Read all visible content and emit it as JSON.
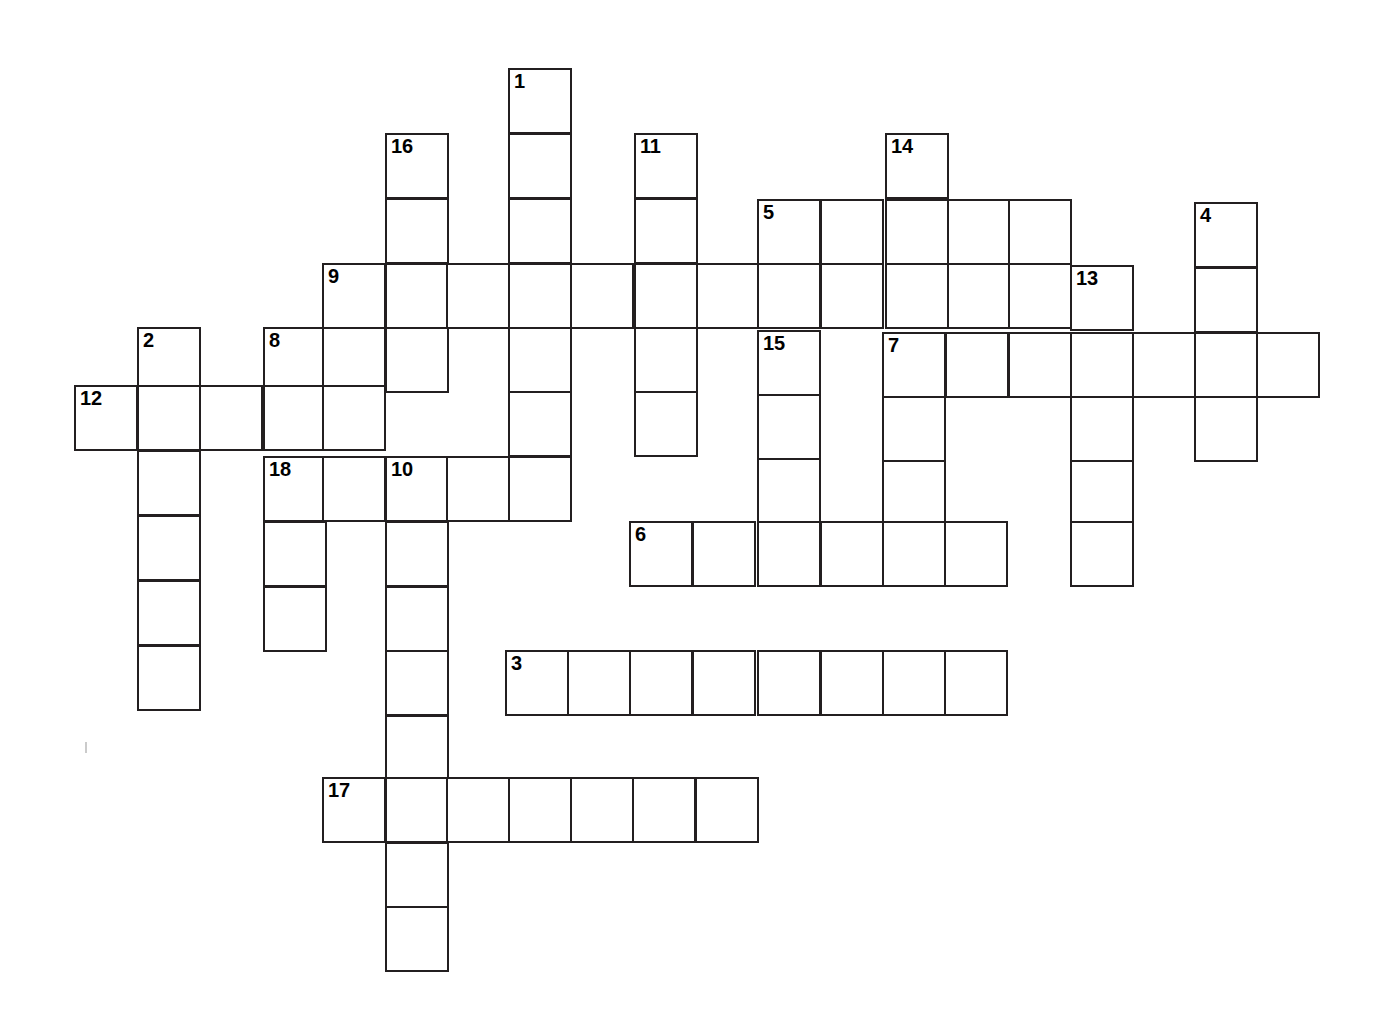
{
  "puzzle": {
    "title": "Crossword Puzzle Grid",
    "cell_size": 64,
    "col_origin_x": 74,
    "row_origin_y": 68,
    "col_step": 62.8,
    "row_step": 64.6,
    "grid_colors": {
      "cell_fill": "#ffffff",
      "cell_border": "#231f20",
      "number_text": "#000000",
      "page_background": "#ffffff"
    },
    "entry_count": 18,
    "numbers_visible": [
      "1",
      "2",
      "3",
      "4",
      "5",
      "6",
      "7",
      "8",
      "9",
      "10",
      "11",
      "12",
      "13",
      "14",
      "15",
      "16",
      "17",
      "18"
    ],
    "entries": [
      {
        "number": "1",
        "label": "1",
        "direction": "down",
        "col": 7,
        "row": 0,
        "length": 8
      },
      {
        "number": "2",
        "label": "2",
        "direction": "down",
        "col": 1,
        "row": 4,
        "length": 6
      },
      {
        "number": "3",
        "label": "3",
        "direction": "across",
        "col": 7,
        "row": 9,
        "length": 8
      },
      {
        "number": "4",
        "label": "4",
        "direction": "down",
        "col": 18,
        "row": 2,
        "length": 4
      },
      {
        "number": "5",
        "label": "5",
        "direction": "across",
        "col": 11,
        "row": 2,
        "length": 5
      },
      {
        "number": "6",
        "label": "6",
        "direction": "across",
        "col": 9,
        "row": 7,
        "length": 6
      },
      {
        "number": "7",
        "label": "7",
        "direction": "across",
        "col": 13,
        "row": 4,
        "length": 7
      },
      {
        "number": "8",
        "label": "8",
        "direction": "down",
        "col": 3,
        "row": 4,
        "length": 2
      },
      {
        "number": "9",
        "label": "9",
        "direction": "across",
        "col": 4,
        "row": 3,
        "length": 13
      },
      {
        "number": "10",
        "label": "10",
        "direction": "down",
        "col": 5,
        "row": 6,
        "length": 8
      },
      {
        "number": "11",
        "label": "11",
        "direction": "down",
        "col": 9,
        "row": 1,
        "length": 5
      },
      {
        "number": "12",
        "label": "12",
        "direction": "across",
        "col": 0,
        "row": 5,
        "length": 5
      },
      {
        "number": "13",
        "label": "13",
        "direction": "down",
        "col": 16,
        "row": 3,
        "length": 5
      },
      {
        "number": "14",
        "label": "14",
        "direction": "down",
        "col": 13,
        "row": 1,
        "length": 4
      },
      {
        "number": "15",
        "label": "15",
        "direction": "down",
        "col": 11,
        "row": 4,
        "length": 5
      },
      {
        "number": "16",
        "label": "16",
        "direction": "down",
        "col": 5,
        "row": 1,
        "length": 4
      },
      {
        "number": "17",
        "label": "17",
        "direction": "across",
        "col": 4,
        "row": 11,
        "length": 7
      },
      {
        "number": "18",
        "label": "18",
        "direction": "down",
        "col": 3,
        "row": 6,
        "length": 3
      }
    ],
    "cells": [
      {
        "x": 508,
        "y": 68,
        "n": "1"
      },
      {
        "x": 508,
        "y": 133,
        "n": ""
      },
      {
        "x": 385,
        "y": 133,
        "n": "16"
      },
      {
        "x": 634,
        "y": 133,
        "n": "11"
      },
      {
        "x": 885,
        "y": 133,
        "n": "14"
      },
      {
        "x": 385,
        "y": 198,
        "n": ""
      },
      {
        "x": 508,
        "y": 198,
        "n": ""
      },
      {
        "x": 634,
        "y": 198,
        "n": ""
      },
      {
        "x": 757,
        "y": 199,
        "n": "5"
      },
      {
        "x": 820,
        "y": 199,
        "n": ""
      },
      {
        "x": 885,
        "y": 199,
        "n": ""
      },
      {
        "x": 947,
        "y": 199,
        "n": ""
      },
      {
        "x": 1008,
        "y": 199,
        "n": ""
      },
      {
        "x": 1194,
        "y": 202,
        "n": "4"
      },
      {
        "x": 322,
        "y": 263,
        "n": "9"
      },
      {
        "x": 385,
        "y": 263,
        "n": ""
      },
      {
        "x": 446,
        "y": 263,
        "n": ""
      },
      {
        "x": 508,
        "y": 263,
        "n": ""
      },
      {
        "x": 570,
        "y": 263,
        "n": ""
      },
      {
        "x": 634,
        "y": 263,
        "n": ""
      },
      {
        "x": 696,
        "y": 263,
        "n": ""
      },
      {
        "x": 757,
        "y": 263,
        "n": ""
      },
      {
        "x": 820,
        "y": 263,
        "n": ""
      },
      {
        "x": 885,
        "y": 263,
        "n": ""
      },
      {
        "x": 947,
        "y": 263,
        "n": ""
      },
      {
        "x": 1008,
        "y": 263,
        "n": ""
      },
      {
        "x": 1070,
        "y": 265,
        "n": "13"
      },
      {
        "x": 1194,
        "y": 267,
        "n": ""
      },
      {
        "x": 137,
        "y": 327,
        "n": "2"
      },
      {
        "x": 263,
        "y": 327,
        "n": "8"
      },
      {
        "x": 322,
        "y": 327,
        "n": ""
      },
      {
        "x": 385,
        "y": 327,
        "n": ""
      },
      {
        "x": 508,
        "y": 327,
        "n": ""
      },
      {
        "x": 634,
        "y": 327,
        "n": ""
      },
      {
        "x": 757,
        "y": 330,
        "n": "15"
      },
      {
        "x": 882,
        "y": 332,
        "n": "7"
      },
      {
        "x": 945,
        "y": 332,
        "n": ""
      },
      {
        "x": 1008,
        "y": 332,
        "n": ""
      },
      {
        "x": 1070,
        "y": 332,
        "n": ""
      },
      {
        "x": 1132,
        "y": 332,
        "n": ""
      },
      {
        "x": 1194,
        "y": 332,
        "n": ""
      },
      {
        "x": 1256,
        "y": 332,
        "n": ""
      },
      {
        "x": 74,
        "y": 385,
        "n": "12"
      },
      {
        "x": 137,
        "y": 385,
        "n": ""
      },
      {
        "x": 199,
        "y": 385,
        "n": ""
      },
      {
        "x": 263,
        "y": 385,
        "n": ""
      },
      {
        "x": 322,
        "y": 385,
        "n": ""
      },
      {
        "x": 508,
        "y": 391,
        "n": ""
      },
      {
        "x": 634,
        "y": 391,
        "n": ""
      },
      {
        "x": 757,
        "y": 394,
        "n": ""
      },
      {
        "x": 882,
        "y": 396,
        "n": ""
      },
      {
        "x": 1070,
        "y": 396,
        "n": ""
      },
      {
        "x": 1194,
        "y": 396,
        "n": ""
      },
      {
        "x": 137,
        "y": 450,
        "n": ""
      },
      {
        "x": 263,
        "y": 456,
        "n": "18"
      },
      {
        "x": 322,
        "y": 456,
        "n": ""
      },
      {
        "x": 385,
        "y": 456,
        "n": "10"
      },
      {
        "x": 446,
        "y": 456,
        "n": ""
      },
      {
        "x": 508,
        "y": 456,
        "n": ""
      },
      {
        "x": 757,
        "y": 458,
        "n": ""
      },
      {
        "x": 882,
        "y": 460,
        "n": ""
      },
      {
        "x": 1070,
        "y": 460,
        "n": ""
      },
      {
        "x": 137,
        "y": 515,
        "n": ""
      },
      {
        "x": 263,
        "y": 521,
        "n": ""
      },
      {
        "x": 385,
        "y": 521,
        "n": ""
      },
      {
        "x": 629,
        "y": 521,
        "n": "6"
      },
      {
        "x": 692,
        "y": 521,
        "n": ""
      },
      {
        "x": 757,
        "y": 521,
        "n": ""
      },
      {
        "x": 820,
        "y": 521,
        "n": ""
      },
      {
        "x": 882,
        "y": 521,
        "n": ""
      },
      {
        "x": 944,
        "y": 521,
        "n": ""
      },
      {
        "x": 1070,
        "y": 521,
        "n": ""
      },
      {
        "x": 137,
        "y": 580,
        "n": ""
      },
      {
        "x": 263,
        "y": 586,
        "n": ""
      },
      {
        "x": 385,
        "y": 586,
        "n": ""
      },
      {
        "x": 137,
        "y": 645,
        "n": ""
      },
      {
        "x": 385,
        "y": 650,
        "n": ""
      },
      {
        "x": 505,
        "y": 650,
        "n": "3"
      },
      {
        "x": 567,
        "y": 650,
        "n": ""
      },
      {
        "x": 629,
        "y": 650,
        "n": ""
      },
      {
        "x": 692,
        "y": 650,
        "n": ""
      },
      {
        "x": 757,
        "y": 650,
        "n": ""
      },
      {
        "x": 820,
        "y": 650,
        "n": ""
      },
      {
        "x": 882,
        "y": 650,
        "n": ""
      },
      {
        "x": 944,
        "y": 650,
        "n": ""
      },
      {
        "x": 385,
        "y": 715,
        "n": ""
      },
      {
        "x": 322,
        "y": 777,
        "n": "17"
      },
      {
        "x": 385,
        "y": 777,
        "n": ""
      },
      {
        "x": 446,
        "y": 777,
        "n": ""
      },
      {
        "x": 508,
        "y": 777,
        "n": ""
      },
      {
        "x": 570,
        "y": 777,
        "n": ""
      },
      {
        "x": 632,
        "y": 777,
        "n": ""
      },
      {
        "x": 695,
        "y": 777,
        "n": ""
      },
      {
        "x": 385,
        "y": 842,
        "n": ""
      },
      {
        "x": 385,
        "y": 906,
        "n": ""
      }
    ],
    "specks": [
      {
        "x": 85,
        "y": 742
      }
    ]
  }
}
